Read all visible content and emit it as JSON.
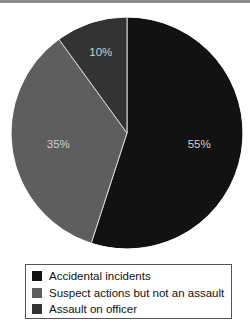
{
  "chart_data": {
    "type": "pie",
    "title": "",
    "start": "12 o'clock",
    "direction": "clockwise",
    "slices": [
      {
        "label": "Accidental incidents",
        "value": 55,
        "display": "55%",
        "color": "#121212"
      },
      {
        "label": "Suspect actions but not an assault",
        "value": 35,
        "display": "35%",
        "color": "#5e5e5e"
      },
      {
        "label": "Assault on officer",
        "value": 10,
        "display": "10%",
        "color": "#333333"
      }
    ],
    "separator_color": "#d8d8d8",
    "label_color": "#d0d0d0",
    "legend_position": "bottom"
  }
}
